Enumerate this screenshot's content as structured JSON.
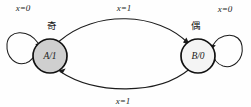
{
  "diagram": {
    "type": "finite-state-machine",
    "title": "",
    "background_color": "#fefefe",
    "stroke_color": "#1c1c1c",
    "states": [
      {
        "id": "A",
        "label": "A/1",
        "annotation": "奇",
        "fill_color": "#cfcfcf",
        "border_color": "#111111",
        "cx": 50,
        "cy": 56,
        "r": 17
      },
      {
        "id": "B",
        "label": "B/0",
        "annotation": "偶",
        "fill_color": "#f4f4f4",
        "border_color": "#111111",
        "cx": 198,
        "cy": 56,
        "r": 17
      }
    ],
    "transitions": [
      {
        "from": "A",
        "to": "A",
        "label": "x=0",
        "kind": "self-loop",
        "position": "upper-left"
      },
      {
        "from": "A",
        "to": "B",
        "label": "x=1",
        "kind": "arc",
        "position": "top"
      },
      {
        "from": "B",
        "to": "A",
        "label": "x=1",
        "kind": "arc",
        "position": "bottom"
      },
      {
        "from": "B",
        "to": "B",
        "label": "x=0",
        "kind": "self-loop",
        "position": "upper-right"
      }
    ]
  }
}
